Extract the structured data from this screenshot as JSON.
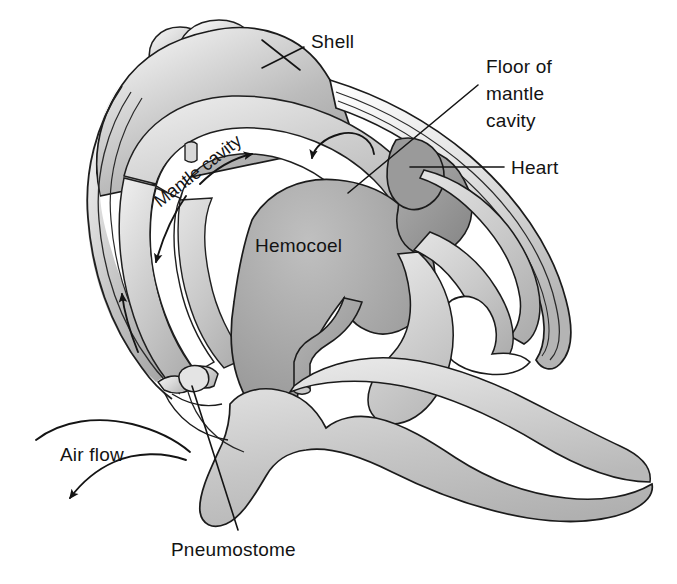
{
  "figure": {
    "background_color": "#ffffff",
    "ink_color": "#131313",
    "width": 677,
    "height": 584
  },
  "palette": {
    "shell_light": "#e9e9e9",
    "shell_mid": "#c4c4c4",
    "shell_dark": "#9a9a9a",
    "mantle_light": "#dcdcdc",
    "tissue_light": "#cfcfcf",
    "tissue_mid": "#bdbdbd",
    "hemocoel_fill": "#a9a9a9",
    "heart_fill": "#9d9d9d",
    "cavity_white": "#ffffff",
    "outline": "#1b1b1b"
  },
  "labels": [
    {
      "id": "shell",
      "text": "Shell",
      "lines": [
        "Shell"
      ],
      "x": 311,
      "y": 48,
      "anchor": "start"
    },
    {
      "id": "floor-of-mantle-cavity",
      "text": "Floor of mantle cavity",
      "lines": [
        "Floor of",
        "mantle",
        "cavity"
      ],
      "x": 486,
      "y": 73,
      "anchor": "start"
    },
    {
      "id": "heart",
      "text": "Heart",
      "lines": [
        "Heart"
      ],
      "x": 511,
      "y": 174,
      "anchor": "start"
    },
    {
      "id": "hemocoel",
      "text": "Hemocoel",
      "lines": [
        "Hemocoel"
      ],
      "x": 255,
      "y": 252,
      "anchor": "start"
    },
    {
      "id": "mantle-cavity",
      "text": "Mantle cavity",
      "lines": [
        "Mantle cavity"
      ],
      "x": 160,
      "y": 208,
      "anchor": "start",
      "rotation": -38
    },
    {
      "id": "air-flow",
      "text": "Air flow",
      "lines": [
        "Air flow"
      ],
      "x": 60,
      "y": 461,
      "anchor": "start"
    },
    {
      "id": "pneumostome",
      "text": "Pneumostome",
      "lines": [
        "Pneumostome"
      ],
      "x": 171,
      "y": 556,
      "anchor": "start"
    }
  ],
  "structures": [
    {
      "id": "shell",
      "name": "Shell"
    },
    {
      "id": "shell-apex",
      "name": "Shell apex whorls"
    },
    {
      "id": "mantle-cavity",
      "name": "Mantle cavity"
    },
    {
      "id": "floor-of-mantle-cavity",
      "name": "Floor of mantle cavity"
    },
    {
      "id": "heart",
      "name": "Heart"
    },
    {
      "id": "hemocoel",
      "name": "Hemocoel"
    },
    {
      "id": "pneumostome",
      "name": "Pneumostome"
    },
    {
      "id": "foot",
      "name": "Foot / body mass"
    },
    {
      "id": "duct",
      "name": "Duct / vessel"
    }
  ],
  "flow_arrows": [
    {
      "id": "arrow-inbound-right",
      "direction": "leftward",
      "description": "Air entering along roof of mantle cavity"
    },
    {
      "id": "arrow-mantle-top",
      "direction": "rightward",
      "description": "Air moving right under shell roof"
    },
    {
      "id": "arrow-mantle-down-left",
      "direction": "downward-left",
      "description": "Air descending on left side"
    },
    {
      "id": "arrow-mantle-up-left",
      "direction": "upward",
      "description": "Air rising along left wall"
    },
    {
      "id": "arrow-air-flow-in",
      "direction": "inward",
      "description": "Air flow entering pneumostome"
    },
    {
      "id": "arrow-air-flow-out",
      "direction": "downward-left",
      "description": "Air flow exiting pneumostome"
    }
  ]
}
